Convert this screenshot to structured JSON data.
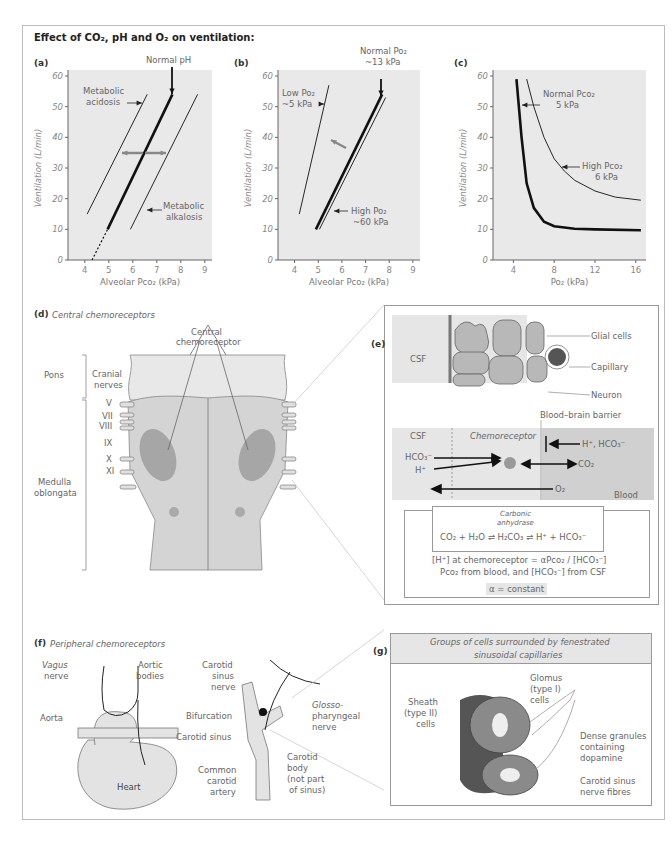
{
  "title": "Effect of CO₂, pH and O₂ on ventilation:",
  "chart_data": [
    {
      "type": "line",
      "panel": "(a)",
      "title": "",
      "xlabel": "Alveolar Pco₂ (kPa)",
      "ylabel": "Ventilation (L/min)",
      "xlim": [
        3.3,
        9.3
      ],
      "ylim": [
        0,
        62
      ],
      "xticks": [
        4,
        5,
        6,
        7,
        8,
        9
      ],
      "yticks": [
        0,
        10,
        20,
        30,
        40,
        50,
        60
      ],
      "series": [
        {
          "name": "Normal pH",
          "style": "thick",
          "points": [
            [
              4.95,
              10
            ],
            [
              7.65,
              54
            ]
          ],
          "extrapolated": [
            [
              4.3,
              0
            ],
            [
              4.95,
              10
            ]
          ]
        },
        {
          "name": "Metabolic acidosis",
          "style": "thin",
          "points": [
            [
              4.1,
              15
            ],
            [
              6.6,
              54
            ]
          ]
        },
        {
          "name": "Metabolic alkalosis",
          "style": "thin",
          "points": [
            [
              5.9,
              10
            ],
            [
              8.7,
              54
            ]
          ]
        }
      ],
      "annotations": [
        "Normal pH",
        "Metabolic acidosis",
        "Metabolic alkalosis"
      ]
    },
    {
      "type": "line",
      "panel": "(b)",
      "xlabel": "Alveolar Pco₂ (kPa)",
      "ylabel": "Ventilation (L/min)",
      "xlim": [
        3.3,
        9.3
      ],
      "ylim": [
        0,
        62
      ],
      "xticks": [
        4,
        5,
        6,
        7,
        8,
        9
      ],
      "yticks": [
        0,
        10,
        20,
        30,
        40,
        50,
        60
      ],
      "series": [
        {
          "name": "Normal Po₂ ~13 kPa",
          "style": "thick",
          "points": [
            [
              4.9,
              10
            ],
            [
              7.7,
              54
            ]
          ]
        },
        {
          "name": "High Po₂ ~60 kPa",
          "style": "thin",
          "points": [
            [
              5.05,
              10
            ],
            [
              7.85,
              53
            ]
          ]
        },
        {
          "name": "Low Po₂ ~5 kPa",
          "style": "thin",
          "points": [
            [
              4.2,
              15
            ],
            [
              5.45,
              57
            ]
          ]
        }
      ],
      "annotations": [
        "Normal Po₂",
        "~13 kPa",
        "Low Po₂",
        "~5 kPa",
        "High Po₂",
        "~60 kPa"
      ]
    },
    {
      "type": "line",
      "panel": "(c)",
      "xlabel": "Po₂ (kPa)",
      "ylabel": "Ventilation (L/min)",
      "xlim": [
        2,
        17
      ],
      "ylim": [
        0,
        62
      ],
      "xticks": [
        4,
        8,
        12,
        16
      ],
      "yticks": [
        0,
        10,
        20,
        30,
        40,
        50,
        60
      ],
      "series": [
        {
          "name": "Normal Pco₂ 5 kPa",
          "style": "thick",
          "points": [
            [
              4.3,
              59
            ],
            [
              4.8,
              40
            ],
            [
              5.3,
              25
            ],
            [
              6,
              17
            ],
            [
              7,
              12.5
            ],
            [
              8,
              11
            ],
            [
              10,
              10.2
            ],
            [
              12,
              10
            ],
            [
              16.5,
              9.7
            ]
          ]
        },
        {
          "name": "High Pco₂ 6 kPa",
          "style": "thin",
          "points": [
            [
              5.3,
              59
            ],
            [
              6,
              50
            ],
            [
              7,
              40
            ],
            [
              8,
              33
            ],
            [
              9,
              29
            ],
            [
              10,
              26
            ],
            [
              12,
              22.5
            ],
            [
              14,
              20.5
            ],
            [
              16.5,
              19.5
            ]
          ]
        }
      ],
      "annotations": [
        "Normal Pco₂",
        "5 kPa",
        "High Pco₂",
        "6 kPa"
      ]
    }
  ],
  "panel_d": {
    "label": "(d)",
    "title": "Central chemoreceptors",
    "central_chemoreceptor": [
      "Central",
      "chemoreceptor"
    ],
    "pons": "Pons",
    "cranial_nerves": [
      "Cranial",
      "nerves"
    ],
    "nerve_numbers": [
      "V",
      "VII",
      "VIII",
      "IX",
      "X",
      "XI"
    ],
    "medulla": [
      "Medulla",
      "oblongata"
    ]
  },
  "panel_e": {
    "label": "(e)",
    "csf": "CSF",
    "glial_cells": "Glial cells",
    "capillary": "Capillary",
    "neuron": "Neuron",
    "bbb": "Blood–brain barrier",
    "csf2": "CSF",
    "chemoreceptor": "Chemoreceptor",
    "hco3": "HCO₃⁻",
    "h": "H⁺",
    "h_hco3": "H⁺, HCO₃⁻",
    "co2": "CO₂",
    "o2": "O₂",
    "blood": "Blood",
    "carbonic_anhydrase": [
      "Carbonic",
      "anhydrase"
    ],
    "equation": "CO₂ + H₂O ⇌ H₂CO₃ ⇌ H⁺ + HCO₃⁻",
    "formula": "[H⁺] at chemoreceptor = αPco₂ / [HCO₃⁻]",
    "formula_note": "Pco₂ from blood, and [HCO₃⁻] from CSF",
    "alpha": "α = constant"
  },
  "panel_f": {
    "label": "(f)",
    "title": "Peripheral chemoreceptors",
    "vagus": [
      "Vagus",
      "nerve"
    ],
    "aortic": [
      "Aortic",
      "bodies"
    ],
    "aorta": "Aorta",
    "heart": "Heart",
    "carotid_sinus_nerve": [
      "Carotid",
      "sinus",
      "nerve"
    ],
    "bifurcation": "Bifurcation",
    "carotid_sinus": "Carotid sinus",
    "common_carotid": [
      "Common",
      "carotid",
      "artery"
    ],
    "glosso": [
      "Glosso-",
      "pharyngeal",
      "nerve"
    ],
    "carotid_body": [
      "Carotid",
      "body",
      "(not part",
      "of sinus)"
    ]
  },
  "panel_g": {
    "label": "(g)",
    "header": [
      "Groups of cells surrounded by fenestrated",
      "sinusoidal capillaries"
    ],
    "glomus": [
      "Glomus",
      "(type I)",
      "cells"
    ],
    "sheath": [
      "Sheath",
      "(type II)",
      "cells"
    ],
    "granules": [
      "Dense granules",
      "containing",
      "dopamine"
    ],
    "nerve": [
      "Carotid sinus",
      "nerve fibres"
    ]
  }
}
